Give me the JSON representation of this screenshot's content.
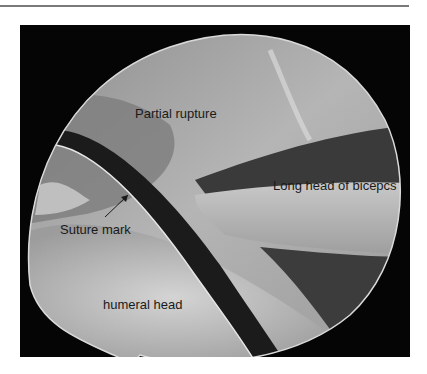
{
  "figure": {
    "image_type": "arthroscopic view",
    "labels": {
      "partial_rupture": "Partial rupture",
      "long_head": "Long head of bicepcs",
      "suture_mark": "Suture mark",
      "humeral_head": "humeral head"
    }
  }
}
